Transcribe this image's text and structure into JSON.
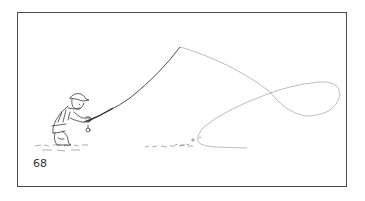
{
  "figure": {
    "page_number": "68",
    "border_color": "#4a4a4a",
    "ink_color": "#3a3a3a",
    "line_color": "#9a9a9a"
  }
}
